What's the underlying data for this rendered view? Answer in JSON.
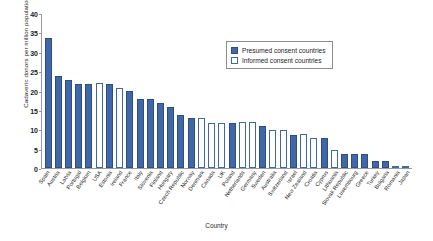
{
  "chart_data": {
    "type": "bar",
    "title": "",
    "xlabel": "Country",
    "ylabel": "Cadaveric donors per million population, 2002",
    "ylim": [
      0,
      40
    ],
    "yticks": [
      0,
      5,
      10,
      15,
      20,
      25,
      30,
      35,
      40
    ],
    "grid": false,
    "legend_position": "top-right",
    "legend": [
      {
        "label": "Presumed consent countries",
        "style": "filled",
        "color": "#4067a8"
      },
      {
        "label": "Informed consent countries",
        "style": "outlined",
        "color": "#ffffff"
      }
    ],
    "categories": [
      "Spain",
      "Austria",
      "Latvia",
      "Portugal",
      "Belgium",
      "USA",
      "Estonia",
      "Ireland",
      "France",
      "Italy",
      "Slovenia",
      "Finland",
      "Hungary",
      "Czech Republic",
      "Norway",
      "Denmark",
      "Canada",
      "UK",
      "Poland",
      "Netherlands",
      "Germany",
      "Sweden",
      "Australia",
      "Switzerland",
      "Israel",
      "New Zealand",
      "Croatia",
      "Cyprus",
      "Lithuania",
      "Slovak Republic",
      "Luxembourg",
      "Greece",
      "Turkey",
      "Bulgaria",
      "Romania",
      "Japan"
    ],
    "values": [
      33.8,
      23.8,
      22.8,
      21.8,
      21.8,
      22.0,
      21.8,
      20.9,
      19.9,
      17.9,
      17.9,
      16.8,
      15.9,
      13.8,
      12.9,
      12.9,
      11.8,
      11.8,
      11.8,
      11.9,
      11.9,
      10.8,
      9.8,
      9.8,
      8.7,
      8.9,
      7.7,
      7.7,
      4.8,
      3.7,
      3.7,
      3.7,
      1.8,
      1.8,
      0.6,
      0.6
    ],
    "consent_types": [
      "presumed",
      "presumed",
      "presumed",
      "presumed",
      "presumed",
      "informed",
      "presumed",
      "informed",
      "presumed",
      "presumed",
      "presumed",
      "presumed",
      "presumed",
      "presumed",
      "presumed",
      "informed",
      "informed",
      "informed",
      "presumed",
      "informed",
      "informed",
      "presumed",
      "informed",
      "informed",
      "presumed",
      "informed",
      "informed",
      "presumed",
      "informed",
      "presumed",
      "presumed",
      "presumed",
      "presumed",
      "presumed",
      "informed",
      "informed"
    ]
  }
}
